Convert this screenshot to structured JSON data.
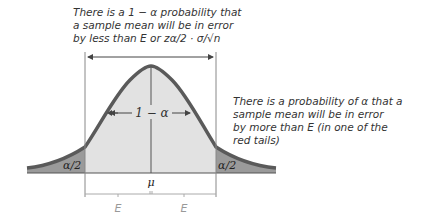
{
  "annotations": {
    "top_note": {
      "lines": [
        "There is a 1 − α probability that",
        "a sample mean will be in error",
        "by less than E or zα/2 · σ/√n"
      ]
    },
    "right_note": {
      "lines": [
        "There is a probability of α that a",
        "sample mean will be in error",
        "by more than E (in one of the",
        "red tails)"
      ]
    }
  },
  "diagram": {
    "center_label": "1 − α",
    "left_tail_label": "α/2",
    "right_tail_label": "α/2",
    "mean_label": "μ",
    "error_left_label": "E",
    "error_right_label": "E"
  },
  "colors": {
    "center_fill": "#e2e2e2",
    "tail_fill": "#9a9a9a",
    "curve_stroke": "#5a5a5a",
    "line": "#555555",
    "bracket": "#aaaaaa",
    "text": "#333333",
    "e_label": "#999999"
  }
}
